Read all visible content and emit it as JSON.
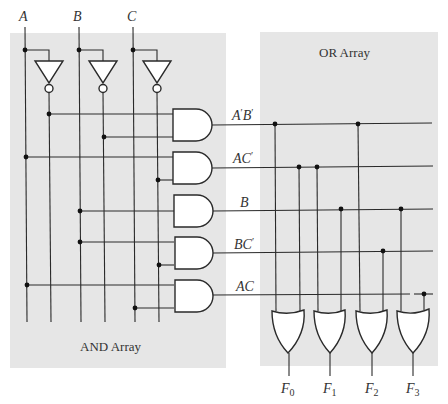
{
  "diagram": {
    "type": "PLA logic diagram",
    "colors": {
      "panel": "#e6e6e6",
      "wire": "#2a2a2a",
      "background": "#ffffff"
    },
    "inputs": [
      {
        "name": "A",
        "label": "A"
      },
      {
        "name": "B",
        "label": "B"
      },
      {
        "name": "C",
        "label": "C"
      }
    ],
    "and_array": {
      "label": "AND Array",
      "product_terms": [
        {
          "id": "t0",
          "label_main": "A'B'",
          "inputs": [
            "A'",
            "B'"
          ]
        },
        {
          "id": "t1",
          "label_main": "AC'",
          "inputs": [
            "A",
            "C'"
          ]
        },
        {
          "id": "t2",
          "label_main": "B",
          "inputs": [
            "B"
          ]
        },
        {
          "id": "t3",
          "label_main": "BC'",
          "inputs": [
            "B",
            "C'"
          ]
        },
        {
          "id": "t4",
          "label_main": "AC",
          "inputs": [
            "A",
            "C"
          ]
        }
      ]
    },
    "or_array": {
      "label": "OR Array",
      "outputs": [
        {
          "name": "F0",
          "label": "F",
          "sub": "0",
          "terms": [
            "A'B'",
            "AC'"
          ]
        },
        {
          "name": "F1",
          "label": "F",
          "sub": "1",
          "terms": [
            "AC'",
            "B"
          ]
        },
        {
          "name": "F2",
          "label": "F",
          "sub": "2",
          "terms": [
            "A'B'",
            "BC'"
          ]
        },
        {
          "name": "F3",
          "label": "F",
          "sub": "3",
          "terms": [
            "B",
            "AC"
          ]
        }
      ]
    }
  },
  "labels": {
    "input_a": "A",
    "input_b": "B",
    "input_c": "C",
    "term0_a": "A",
    "term0_b": "B",
    "term1": "AC",
    "term2": "B",
    "term3": "BC",
    "term4": "AC",
    "prime": "′",
    "and_array": "AND Array",
    "or_array": "OR Array",
    "f0": "F",
    "f0_sub": "0",
    "f1": "F",
    "f1_sub": "1",
    "f2": "F",
    "f2_sub": "2",
    "f3": "F",
    "f3_sub": "3"
  }
}
